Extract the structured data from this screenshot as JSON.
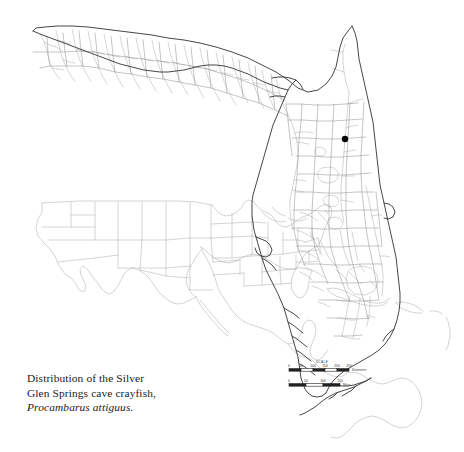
{
  "figure": {
    "background_color": "#ffffff",
    "width": 464,
    "height": 452
  },
  "caption": {
    "line1": "Distribution of the Silver",
    "line2": "Glen Springs cave crayfish,",
    "species": "Procambarus attiguus."
  },
  "main_map": {
    "name": "florida-state-map",
    "region": "Florida, USA",
    "outline_color": "#3d3d3d",
    "detail_color": "#8d8d8d",
    "county_color": "#9a9a9a",
    "occurrence": {
      "label": "Silver Glen Springs locality",
      "marker_color": "#000000",
      "x": 345,
      "y": 139,
      "radius": 3.2
    }
  },
  "inset_map": {
    "name": "north-america-inset",
    "region": "North America, Central America, Caribbean and northern South America",
    "line_color": "#a8a8a8",
    "x": 25,
    "y": 198,
    "width": 212,
    "height": 165
  },
  "scale_bar": {
    "title": "SCALE",
    "km": {
      "unit": "Kilometers",
      "ticks": [
        "0",
        "50",
        "100",
        "150",
        "200",
        "250"
      ]
    },
    "mi": {
      "unit": "Miles",
      "ticks": [
        "0",
        "50",
        "100",
        "150"
      ]
    }
  }
}
